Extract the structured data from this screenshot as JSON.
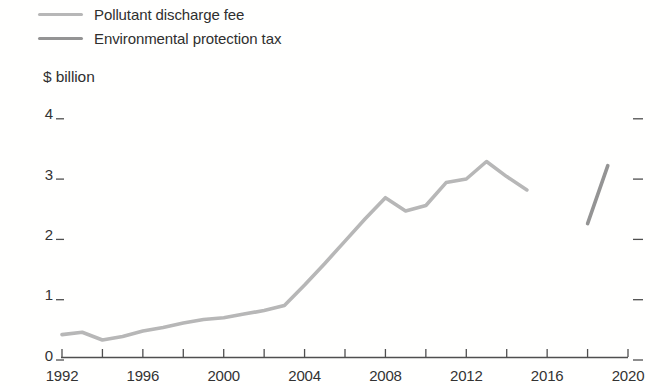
{
  "legend": {
    "items": [
      {
        "label": "Pollutant discharge fee",
        "color": "#b7b7b7"
      },
      {
        "label": "Environmental protection tax",
        "color": "#949494"
      }
    ]
  },
  "colors": {
    "axis": "#4f4f4f",
    "tick": "#4f4f4f",
    "text": "#333333",
    "background": "#ffffff"
  },
  "chart_data": {
    "type": "line",
    "title": "",
    "ylabel": "$ billion",
    "xlabel": "",
    "ylim": [
      0,
      4
    ],
    "yticks": [
      0,
      1,
      2,
      3,
      4
    ],
    "xlim": [
      1992,
      2020
    ],
    "xtick_labels": [
      1992,
      1996,
      2000,
      2004,
      2008,
      2012,
      2016,
      2020
    ],
    "x_minor_tick_step": 2,
    "grid": false,
    "legend_position": "top-left",
    "series": [
      {
        "name": "Pollutant discharge fee",
        "color": "#b7b7b7",
        "x": [
          1992,
          1993,
          1994,
          1995,
          1996,
          1997,
          1998,
          1999,
          2000,
          2001,
          2002,
          2003,
          2004,
          2005,
          2006,
          2007,
          2008,
          2009,
          2010,
          2011,
          2012,
          2013,
          2014,
          2015
        ],
        "y": [
          0.38,
          0.42,
          0.29,
          0.35,
          0.44,
          0.5,
          0.57,
          0.63,
          0.66,
          0.72,
          0.78,
          0.86,
          1.2,
          1.56,
          1.93,
          2.3,
          2.65,
          2.43,
          2.52,
          2.9,
          2.96,
          3.25,
          3.0,
          2.78
        ]
      },
      {
        "name": "Environmental protection tax",
        "color": "#949494",
        "x": [
          2018,
          2019
        ],
        "y": [
          2.22,
          3.18
        ]
      }
    ]
  }
}
